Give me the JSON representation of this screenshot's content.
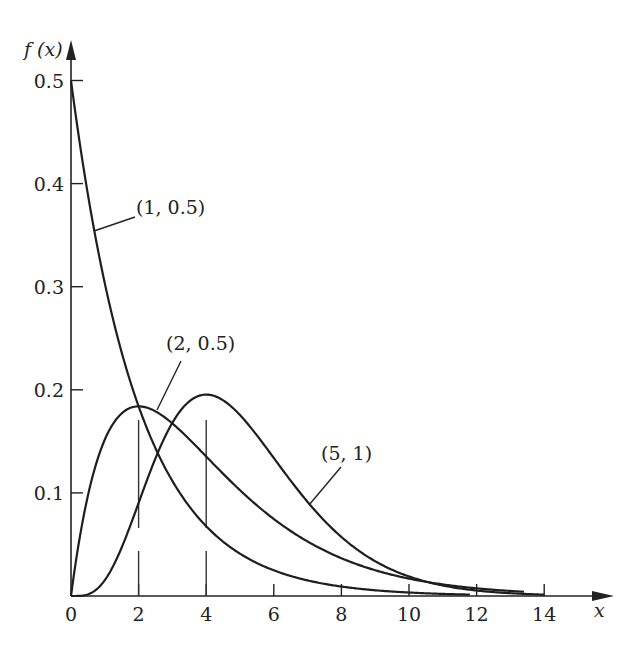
{
  "chart_data": {
    "type": "line",
    "title": "",
    "xlabel": "x",
    "ylabel": "f (x)",
    "xlim": [
      0,
      15.5
    ],
    "ylim": [
      0,
      0.53
    ],
    "x_ticks": [
      0,
      2,
      4,
      6,
      8,
      10,
      12,
      14
    ],
    "x_tick_labels": [
      "0",
      "2",
      "4",
      "6",
      "8",
      "10",
      "12",
      "14"
    ],
    "y_ticks": [
      0.1,
      0.2,
      0.3,
      0.4,
      0.5
    ],
    "y_tick_labels": [
      "0.1",
      "0.2",
      "0.3",
      "0.4",
      "0.5"
    ],
    "grid": false,
    "legend": "none (inline curve labels)",
    "series": [
      {
        "name": "(1, 0.5)",
        "shape": 1,
        "rate": 0.5,
        "x_end": 11.8,
        "x": [
          0,
          1,
          2,
          3,
          4,
          6,
          8,
          10,
          11.8
        ],
        "values": [
          0.5,
          0.303,
          0.184,
          0.112,
          0.068,
          0.025,
          0.009,
          0.003,
          0.001
        ]
      },
      {
        "name": "(2, 0.5)",
        "shape": 2,
        "rate": 0.5,
        "x_end": 13.4,
        "x": [
          0,
          1,
          2,
          3,
          4,
          6,
          8,
          10,
          12,
          13.4
        ],
        "values": [
          0,
          0.152,
          0.184,
          0.167,
          0.135,
          0.075,
          0.037,
          0.017,
          0.007,
          0.004
        ]
      },
      {
        "name": "(5, 1)",
        "shape": 5,
        "rate": 1,
        "x_end": 14,
        "x": [
          0,
          1,
          2,
          3,
          4,
          5,
          6,
          8,
          10,
          12,
          14
        ],
        "values": [
          0,
          0.015,
          0.09,
          0.168,
          0.195,
          0.175,
          0.134,
          0.057,
          0.019,
          0.005,
          0.001
        ]
      }
    ],
    "annotations": [
      {
        "text": "(1, 0.5)",
        "points_to_series": "(1, 0.5)"
      },
      {
        "text": "(2, 0.5)",
        "points_to_series": "(2, 0.5)"
      },
      {
        "text": "(5, 1)",
        "points_to_series": "(5, 1)"
      },
      {
        "text": "dashed vertical line at x = 2 (mode of (2, 0.5))"
      },
      {
        "text": "dashed vertical line at x = 4 (mode of (5, 1))"
      }
    ]
  },
  "labels": {
    "y_axis": "f (x)",
    "x_axis": "x",
    "curve_1": "(1, 0.5)",
    "curve_2": "(2, 0.5)",
    "curve_3": "(5, 1)"
  }
}
